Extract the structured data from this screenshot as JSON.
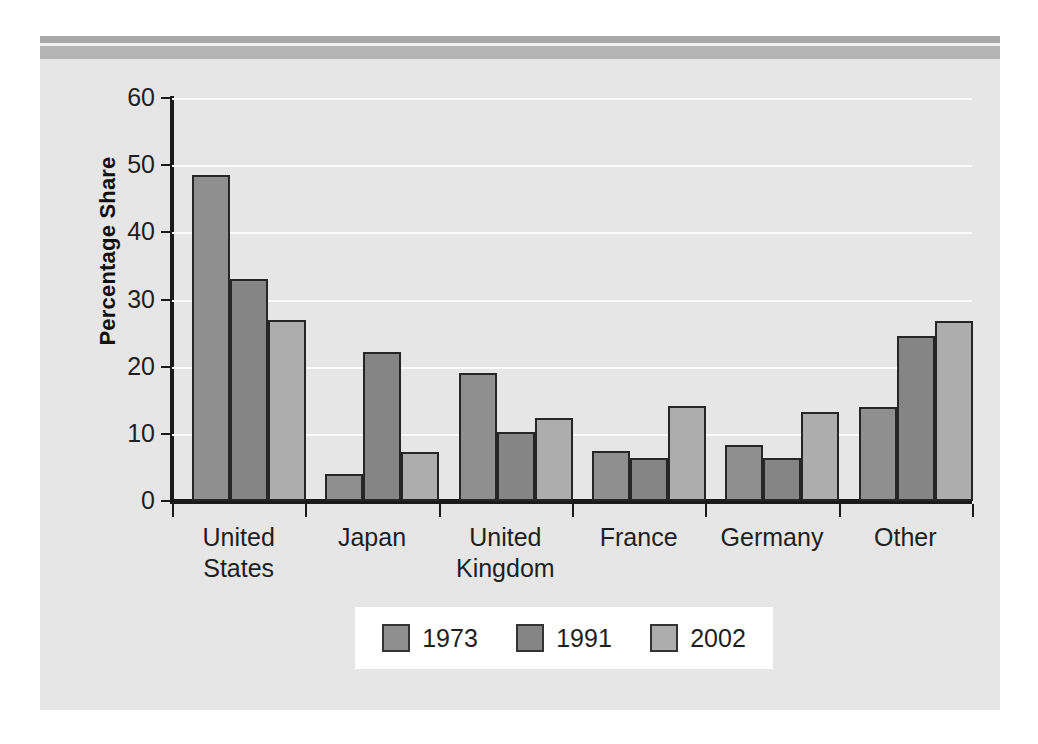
{
  "chart_data": {
    "type": "bar",
    "title": "",
    "subtitle": "",
    "xlabel": "",
    "ylabel": "Percentage Share",
    "ylim": [
      0,
      60
    ],
    "yticks": [
      0,
      10,
      20,
      30,
      40,
      50,
      60
    ],
    "ytick_labels": [
      "0",
      "10",
      "20",
      "30",
      "40",
      "50",
      "60"
    ],
    "grid": true,
    "grid_axis": "y",
    "legend_position": "bottom",
    "categories": [
      "United States",
      "Japan",
      "United Kingdom",
      "France",
      "Germany",
      "Other"
    ],
    "category_lines": [
      [
        "United",
        "States"
      ],
      [
        "Japan"
      ],
      [
        "United",
        "Kingdom"
      ],
      [
        "France"
      ],
      [
        "Germany"
      ],
      [
        "Other"
      ]
    ],
    "series": [
      {
        "name": "1973",
        "color": "#8f8f8f",
        "values": [
          48.5,
          4.0,
          19.0,
          7.5,
          8.3,
          14.0
        ]
      },
      {
        "name": "1991",
        "color": "#858585",
        "values": [
          33.0,
          22.2,
          10.3,
          6.4,
          6.4,
          24.6
        ]
      },
      {
        "name": "2002",
        "color": "#adadad",
        "values": [
          27.0,
          7.3,
          12.4,
          14.1,
          13.2,
          26.8
        ]
      }
    ]
  },
  "figure": {
    "panel_background": "#e6e6e6",
    "header_bar_dark": "#a8a8a8",
    "header_bar_light": "#b4b4b4",
    "gridline_color": "#fbfbfb",
    "axis_color": "#1a1a1a",
    "legend_background": "#ffffff"
  }
}
